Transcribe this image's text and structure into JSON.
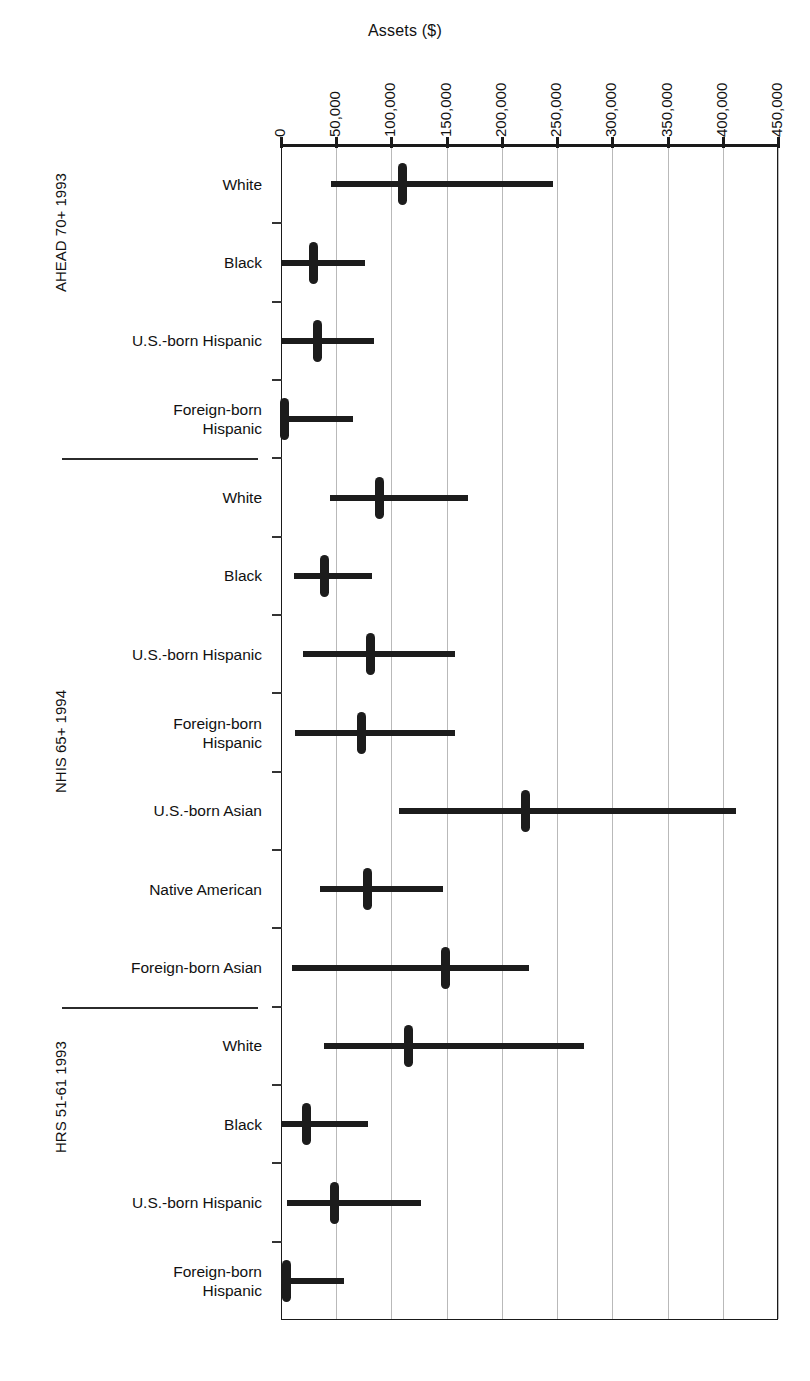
{
  "chart_data": {
    "type": "bar",
    "subtype": "range-plot",
    "title": "Assets ($)",
    "xlabel": "Assets ($)",
    "ylabel": "",
    "xlim": [
      0,
      450000
    ],
    "xticks": [
      0,
      50000,
      100000,
      150000,
      200000,
      250000,
      300000,
      350000,
      400000,
      450000
    ],
    "xticklabels": [
      "0",
      "50,000",
      "100,000",
      "150,000",
      "200,000",
      "250,000",
      "300,000",
      "350,000",
      "400,000",
      "450,000"
    ],
    "grid": "vertical",
    "legend": "none",
    "orientation": "horizontal",
    "marks": {
      "range": "line from lower to upper",
      "center": "thick vertical median marker"
    },
    "groups": [
      {
        "name": "AHEAD 70+ 1993",
        "rows": [
          {
            "label": "White",
            "low": 45000,
            "median": 110000,
            "high": 246000
          },
          {
            "label": "Black",
            "low": 1000,
            "median": 29000,
            "high": 76000
          },
          {
            "label": "U.S.-born Hispanic",
            "low": 1000,
            "median": 33000,
            "high": 84000
          },
          {
            "label": "Foreign-born\nHispanic",
            "low": 0,
            "median": 3000,
            "high": 65000
          }
        ]
      },
      {
        "name": "NHIS 65+ 1994",
        "rows": [
          {
            "label": "White",
            "low": 44000,
            "median": 89000,
            "high": 169000
          },
          {
            "label": "Black",
            "low": 12000,
            "median": 39000,
            "high": 82000
          },
          {
            "label": "U.S.-born Hispanic",
            "low": 20000,
            "median": 81000,
            "high": 158000
          },
          {
            "label": "Foreign-born\nHispanic",
            "low": 13000,
            "median": 73000,
            "high": 158000
          },
          {
            "label": "U.S.-born Asian",
            "low": 107000,
            "median": 221000,
            "high": 412000
          },
          {
            "label": "Native American",
            "low": 35000,
            "median": 78000,
            "high": 147000
          },
          {
            "label": "Foreign-born Asian",
            "low": 10000,
            "median": 149000,
            "high": 225000
          }
        ]
      },
      {
        "name": "HRS 51-61 1993",
        "rows": [
          {
            "label": "White",
            "low": 39000,
            "median": 115000,
            "high": 274000
          },
          {
            "label": "Black",
            "low": 0,
            "median": 23000,
            "high": 79000
          },
          {
            "label": "U.S.-born Hispanic",
            "low": 5000,
            "median": 48000,
            "high": 127000
          },
          {
            "label": "Foreign-born\nHispanic",
            "low": 0,
            "median": 5000,
            "high": 57000
          }
        ]
      }
    ]
  },
  "colors": {
    "mark": "#1c1c1c",
    "grid": "#b9b9b9",
    "axis": "#1a1a1a",
    "text": "#111111",
    "background": "#ffffff"
  }
}
